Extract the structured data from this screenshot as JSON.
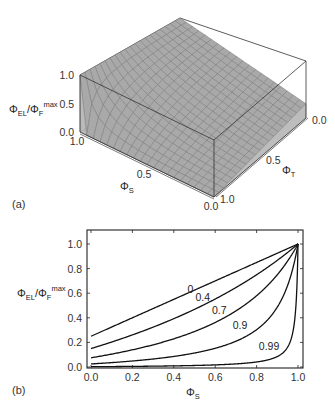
{
  "chart_data": [
    {
      "panel": "(a)",
      "type": "surface3d",
      "title": "",
      "zlabel": "Φ_EL/Φ_F^max",
      "xlabel": "Φ_S",
      "ylabel": "Φ_T",
      "z_ticks": [
        "0.0",
        "0.5",
        "1.0"
      ],
      "x_ticks": [
        "1.0",
        "0.5",
        "0.0"
      ],
      "y_ticks": [
        "0.0",
        "0.5",
        "1.0"
      ],
      "zlim": [
        0,
        1
      ],
      "xlim": [
        0,
        1
      ],
      "ylim": [
        0,
        1
      ],
      "surface_formula": "z = (0.25 + 0.75*S) * (1 - T) / (1 - T*S)",
      "corner_values": [
        {
          "S": 1.0,
          "T": 0.0,
          "z": 1.0
        },
        {
          "S": 1.0,
          "T": 1.0,
          "z": 1.0
        },
        {
          "S": 0.0,
          "T": 0.0,
          "z": 0.25
        },
        {
          "S": 0.0,
          "T": 1.0,
          "z": 0.0
        }
      ],
      "mesh": 20,
      "colors": {
        "surface": "#a9a9a9",
        "mesh": "#777777",
        "box": "#333333"
      }
    },
    {
      "panel": "(b)",
      "type": "line",
      "title": "",
      "xlabel": "Φ_S",
      "ylabel": "Φ_EL/Φ_F^max",
      "xlim": [
        0,
        1
      ],
      "ylim": [
        0,
        1.1
      ],
      "x_ticks": [
        "0.0",
        "0.2",
        "0.4",
        "0.6",
        "0.8",
        "1.0"
      ],
      "y_ticks": [
        "0.0",
        "0.2",
        "0.4",
        "0.6",
        "0.8",
        "1.0"
      ],
      "grid": false,
      "legend": "inline curve labels",
      "x": [
        0.0,
        0.1,
        0.2,
        0.3,
        0.4,
        0.5,
        0.6,
        0.7,
        0.8,
        0.9,
        0.95,
        0.99,
        1.0
      ],
      "series": [
        {
          "name": "0",
          "values": [
            0.25,
            0.325,
            0.4,
            0.475,
            0.55,
            0.625,
            0.7,
            0.775,
            0.85,
            0.925,
            0.963,
            0.993,
            1.0
          ]
        },
        {
          "name": "0.4",
          "values": [
            0.15,
            0.203,
            0.261,
            0.325,
            0.393,
            0.469,
            0.553,
            0.646,
            0.75,
            0.867,
            0.931,
            0.985,
            1.0
          ]
        },
        {
          "name": "0.7",
          "values": [
            0.075,
            0.106,
            0.141,
            0.18,
            0.229,
            0.288,
            0.362,
            0.457,
            0.58,
            0.751,
            0.86,
            0.97,
            1.0
          ]
        },
        {
          "name": "0.9",
          "values": [
            0.025,
            0.036,
            0.049,
            0.065,
            0.086,
            0.114,
            0.152,
            0.209,
            0.304,
            0.5,
            0.67,
            0.911,
            1.0
          ]
        },
        {
          "name": "0.99",
          "values": [
            0.0025,
            0.0036,
            0.0049,
            0.0066,
            0.0087,
            0.0116,
            0.0157,
            0.0222,
            0.0337,
            0.084,
            0.16,
            0.5,
            1.0
          ]
        }
      ],
      "label_positions": [
        {
          "name": "0",
          "x": 0.48,
          "y": 0.6
        },
        {
          "name": "0.4",
          "x": 0.54,
          "y": 0.54
        },
        {
          "name": "0.7",
          "x": 0.62,
          "y": 0.43
        },
        {
          "name": "0.9",
          "x": 0.72,
          "y": 0.31
        },
        {
          "name": "0.99",
          "x": 0.86,
          "y": 0.14
        }
      ]
    }
  ],
  "labels": {
    "panel_a": "(a)",
    "panel_b": "(b)"
  }
}
